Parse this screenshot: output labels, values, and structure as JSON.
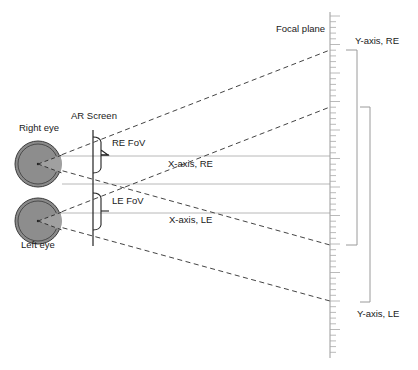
{
  "labels": {
    "focal_plane": "Focal plane",
    "y_axis_re": "Y-axis, RE",
    "y_axis_le": "Y-axis, LE",
    "ar_screen": "AR Screen",
    "right_eye": "Right eye",
    "left_eye": "Left eye",
    "re_fov": "RE FoV",
    "le_fov": "LE FoV",
    "x_axis_re": "X-axis, RE",
    "x_axis_le": "X-axis, LE"
  },
  "colors": {
    "eye_fill": "#8a8a8a",
    "eye_stroke": "#444444",
    "line_dark": "#333333",
    "line_gray": "#b0b0b0",
    "tick_gray": "#9a9a9a"
  }
}
